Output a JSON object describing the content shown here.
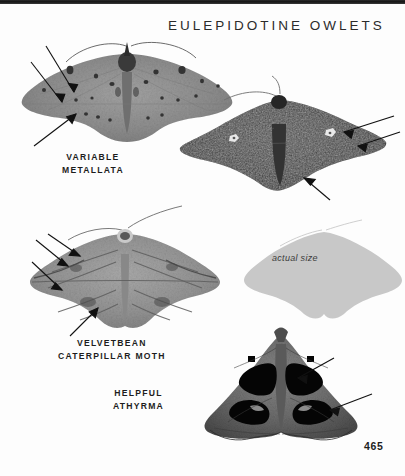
{
  "page": {
    "title": "EULEPIDOTINE OWLETS",
    "number": "465",
    "background_color": "#fdfdfd",
    "text_color": "#1d1d1d",
    "top_rule_color": "#141414"
  },
  "specimens": [
    {
      "id": "variable-metallata",
      "caption_line_1": "VARIABLE",
      "caption_line_2": "METALLATA",
      "color": "#8e8e8e",
      "arrow_count": 3,
      "description": "pale gray spread-wing owlet moth with scattered dark spots"
    },
    {
      "id": "dark-owlet",
      "caption_line_1": "",
      "caption_line_2": "",
      "color": "#3b3b3b",
      "arrow_count": 3,
      "description": "dark charcoal owlet moth with two small white forewing spots"
    },
    {
      "id": "velvetbean-caterpillar-moth",
      "caption_line_1": "VELVETBEAN",
      "caption_line_2": "CATERPILLAR MOTH",
      "color": "#9a9a9a",
      "arrow_count": 4,
      "description": "medium gray moth with wavy transverse bands"
    },
    {
      "id": "helpful-athyrma",
      "caption_line_1": "HELPFUL",
      "caption_line_2": "ATHYRMA",
      "color": "#6a6a6a",
      "arrow_count": 2,
      "description": "triangular dark moth with large black reniform blotches"
    }
  ],
  "actual_size": {
    "label": "actual size",
    "silhouette_color": "#c8c8c8"
  }
}
